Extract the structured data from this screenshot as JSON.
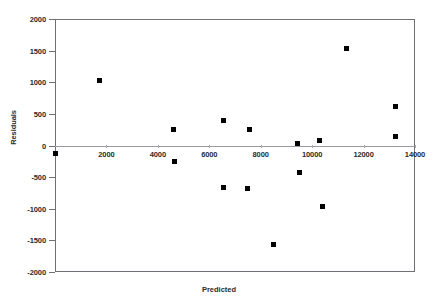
{
  "chart_data": {
    "type": "scatter",
    "title": "",
    "xlabel": "Predicted",
    "ylabel": "Residuals",
    "xlim": [
      0,
      14000
    ],
    "ylim": [
      -2000,
      2000
    ],
    "xticks": [
      2000,
      4000,
      6000,
      8000,
      10000,
      12000,
      14000
    ],
    "yticks": [
      2000,
      1500,
      1000,
      500,
      0,
      -500,
      -1000,
      -1500,
      -2000
    ],
    "xtick_labels": [
      "2000",
      "4000",
      "6000",
      "8000",
      "10000",
      "12000",
      "14000"
    ],
    "ytick_labels": [
      "2000",
      "1500",
      "1000",
      "500",
      "0",
      "-500",
      "-1000",
      "-1500",
      "-2000"
    ],
    "grid": false,
    "legend": false,
    "marker": "square",
    "marker_color": "#000000",
    "zero_line": 0,
    "points": [
      {
        "x": 30,
        "y": -120
      },
      {
        "x": 1720,
        "y": 1020
      },
      {
        "x": 4620,
        "y": 260
      },
      {
        "x": 4660,
        "y": -260
      },
      {
        "x": 6550,
        "y": 390
      },
      {
        "x": 6550,
        "y": -670
      },
      {
        "x": 7560,
        "y": 260
      },
      {
        "x": 7500,
        "y": -680
      },
      {
        "x": 8480,
        "y": -1560
      },
      {
        "x": 9420,
        "y": 30
      },
      {
        "x": 9520,
        "y": -430
      },
      {
        "x": 10300,
        "y": 80
      },
      {
        "x": 10400,
        "y": -960
      },
      {
        "x": 11350,
        "y": 1540
      },
      {
        "x": 13250,
        "y": 620
      },
      {
        "x": 13250,
        "y": 150
      }
    ]
  }
}
